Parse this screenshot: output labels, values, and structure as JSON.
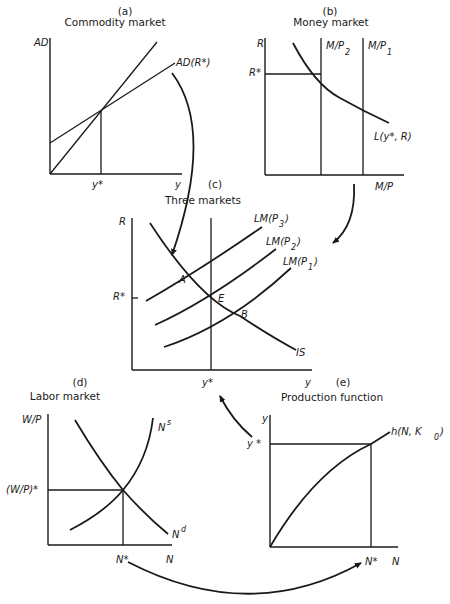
{
  "panels": {
    "a": {
      "letter": "(a)",
      "title": "Commodity market",
      "y_axis": "AD",
      "x_axis": "y",
      "curve_label": "AD(R*)",
      "x_mark": "y*"
    },
    "b": {
      "letter": "(b)",
      "title": "Money market",
      "y_axis": "R",
      "x_axis": "M/P",
      "y_mark": "R*",
      "supply_2": "M/P",
      "supply_2_sub": "2",
      "supply_1": "M/P",
      "supply_1_sub": "1",
      "demand_label": "L(y*, R)"
    },
    "c": {
      "letter": "(c)",
      "title": "Three markets",
      "y_axis": "R",
      "x_axis": "y",
      "y_mark": "R*",
      "x_mark": "y*",
      "lm3": "LM(P",
      "lm3_sub": "3",
      "lm2": "LM(P",
      "lm2_sub": "2",
      "lm1": "LM(P",
      "lm1_sub": "1",
      "close_paren": ")",
      "is_label": "IS",
      "point_a": "A",
      "point_e": "E",
      "point_b": "B"
    },
    "d": {
      "letter": "(d)",
      "title": "Labor market",
      "y_axis": "W/P",
      "x_axis": "N",
      "y_mark": "(W/P)*",
      "x_mark": "N*",
      "supply_label": "N",
      "supply_sup": "s",
      "demand_label": "N",
      "demand_sup": "d"
    },
    "e": {
      "letter": "(e)",
      "title": "Production function",
      "y_axis": "y",
      "x_axis": "N",
      "y_mark": "y *",
      "x_mark": "N*",
      "curve_label": "h(N, K",
      "curve_sub": "0",
      "curve_close": ")"
    }
  },
  "arrows": [
    {
      "from": "a",
      "to": "c",
      "meaning": "AD(R*) feeds IS curve"
    },
    {
      "from": "b",
      "to": "c",
      "meaning": "money market feeds LM curves"
    },
    {
      "from": "d",
      "to": "e",
      "meaning": "N* feeds production function"
    },
    {
      "from": "e",
      "to": "c",
      "meaning": "y* feeds three-markets diagram"
    }
  ]
}
